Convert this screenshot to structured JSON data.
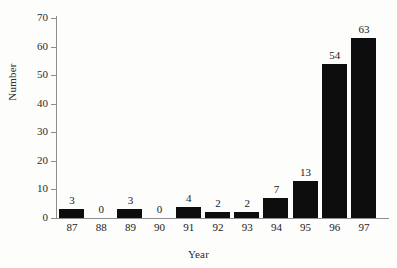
{
  "chart_data": {
    "type": "bar",
    "title": "",
    "xlabel": "Year",
    "ylabel": "Number",
    "categories": [
      "87",
      "88",
      "89",
      "90",
      "91",
      "92",
      "93",
      "94",
      "95",
      "96",
      "97"
    ],
    "values": [
      3,
      0,
      3,
      0,
      4,
      2,
      2,
      7,
      13,
      54,
      63
    ],
    "data_labels": [
      "3",
      "0",
      "3",
      "0",
      "4",
      "2",
      "2",
      "7",
      "13",
      "54",
      "63"
    ],
    "ylim": [
      0,
      70
    ],
    "ytick_labels": [
      "0",
      "10",
      "20",
      "30",
      "40",
      "50",
      "60",
      "70"
    ],
    "ytick_values": [
      0,
      10,
      20,
      30,
      40,
      50,
      60,
      70
    ],
    "grid": false,
    "legend": false,
    "bar_color": "#0d0d0d",
    "axis_color": "#8d8d8d",
    "background_color": "#fdfdfc"
  }
}
